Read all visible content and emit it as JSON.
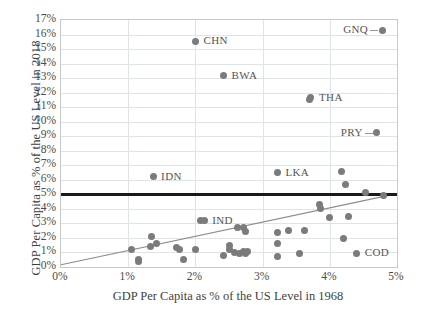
{
  "chart_data": {
    "type": "scatter",
    "title": "",
    "xlabel": "GDP Per Capita as % of the US Level in 1968",
    "ylabel": "GDP Per Capita as % of the US Level in 2018",
    "xlim": [
      0,
      5
    ],
    "ylim": [
      0,
      17
    ],
    "xticks": [
      "0%",
      "1%",
      "2%",
      "3%",
      "4%",
      "5%"
    ],
    "xtick_values": [
      0,
      1,
      2,
      3,
      4,
      5
    ],
    "yticks": [
      "0%",
      "1%",
      "2%",
      "3%",
      "4%",
      "5%",
      "6%",
      "7%",
      "8%",
      "9%",
      "10%",
      "11%",
      "12%",
      "13%",
      "14%",
      "15%",
      "16%",
      "17%"
    ],
    "ytick_values": [
      0,
      1,
      2,
      3,
      4,
      5,
      6,
      7,
      8,
      9,
      10,
      11,
      12,
      13,
      14,
      15,
      16,
      17
    ],
    "grid": true,
    "legend": "none",
    "marker_color": "#7b7b7b",
    "trendline_color": "#8c8c8c",
    "threshold_color": "#1a1a1a",
    "threshold": {
      "label": "",
      "y": 5.0,
      "description": "Horizontal black reference line at 5%"
    },
    "trendline": {
      "x0": 0.0,
      "y0": 0.15,
      "x1": 5.0,
      "y1": 5.05
    },
    "points": [
      {
        "x": 2.0,
        "y": 15.55,
        "label": "CHN"
      },
      {
        "x": 2.42,
        "y": 13.15,
        "label": "BWA"
      },
      {
        "x": 3.72,
        "y": 11.65,
        "label": "THA"
      },
      {
        "x": 3.7,
        "y": 11.55,
        "label": ""
      },
      {
        "x": 4.78,
        "y": 16.3,
        "label": "GNQ"
      },
      {
        "x": 4.7,
        "y": 9.25,
        "label": "PRY"
      },
      {
        "x": 1.37,
        "y": 6.2,
        "label": "IDN"
      },
      {
        "x": 3.22,
        "y": 6.5,
        "label": "LKA"
      },
      {
        "x": 2.08,
        "y": 3.2,
        "label": "IND"
      },
      {
        "x": 2.13,
        "y": 3.2,
        "label": ""
      },
      {
        "x": 4.4,
        "y": 0.95,
        "label": "COD"
      },
      {
        "x": 4.18,
        "y": 6.6,
        "label": ""
      },
      {
        "x": 4.23,
        "y": 5.65,
        "label": ""
      },
      {
        "x": 4.53,
        "y": 5.15,
        "label": ""
      },
      {
        "x": 4.8,
        "y": 4.9,
        "label": ""
      },
      {
        "x": 3.85,
        "y": 4.3,
        "label": ""
      },
      {
        "x": 3.86,
        "y": 4.05,
        "label": ""
      },
      {
        "x": 4.0,
        "y": 3.4,
        "label": ""
      },
      {
        "x": 4.28,
        "y": 3.45,
        "label": ""
      },
      {
        "x": 4.2,
        "y": 1.95,
        "label": ""
      },
      {
        "x": 3.22,
        "y": 2.4,
        "label": ""
      },
      {
        "x": 3.38,
        "y": 2.48,
        "label": ""
      },
      {
        "x": 3.62,
        "y": 2.48,
        "label": ""
      },
      {
        "x": 3.22,
        "y": 1.6,
        "label": ""
      },
      {
        "x": 3.22,
        "y": 0.7,
        "label": ""
      },
      {
        "x": 3.55,
        "y": 0.9,
        "label": ""
      },
      {
        "x": 2.62,
        "y": 2.72,
        "label": ""
      },
      {
        "x": 2.72,
        "y": 2.7,
        "label": ""
      },
      {
        "x": 2.75,
        "y": 2.45,
        "label": ""
      },
      {
        "x": 2.5,
        "y": 1.5,
        "label": ""
      },
      {
        "x": 2.5,
        "y": 1.18,
        "label": ""
      },
      {
        "x": 2.42,
        "y": 0.82,
        "label": ""
      },
      {
        "x": 2.58,
        "y": 0.98,
        "label": ""
      },
      {
        "x": 2.65,
        "y": 0.95,
        "label": ""
      },
      {
        "x": 2.72,
        "y": 1.1,
        "label": ""
      },
      {
        "x": 2.78,
        "y": 1.05,
        "label": ""
      },
      {
        "x": 2.75,
        "y": 0.95,
        "label": ""
      },
      {
        "x": 1.35,
        "y": 2.1,
        "label": ""
      },
      {
        "x": 1.42,
        "y": 1.65,
        "label": ""
      },
      {
        "x": 1.33,
        "y": 1.42,
        "label": ""
      },
      {
        "x": 1.05,
        "y": 1.22,
        "label": ""
      },
      {
        "x": 1.15,
        "y": 0.55,
        "label": ""
      },
      {
        "x": 1.15,
        "y": 0.4,
        "label": ""
      },
      {
        "x": 1.72,
        "y": 1.35,
        "label": ""
      },
      {
        "x": 1.77,
        "y": 1.2,
        "label": ""
      },
      {
        "x": 2.0,
        "y": 1.18,
        "label": ""
      },
      {
        "x": 1.82,
        "y": 0.52,
        "label": ""
      }
    ],
    "point_labels": [
      {
        "text": "CHN",
        "x": 2.0,
        "y": 15.55,
        "leader": false
      },
      {
        "text": "BWA",
        "x": 2.42,
        "y": 13.15,
        "leader": false
      },
      {
        "text": "THA",
        "x": 3.72,
        "y": 11.65,
        "leader": false
      },
      {
        "text": "GNQ",
        "x": 4.78,
        "y": 16.3,
        "leader": true
      },
      {
        "text": "PRY",
        "x": 4.7,
        "y": 9.25,
        "leader": true
      },
      {
        "text": "IDN",
        "x": 1.37,
        "y": 6.2,
        "leader": false
      },
      {
        "text": "LKA",
        "x": 3.22,
        "y": 6.5,
        "leader": false
      },
      {
        "text": "IND",
        "x": 2.13,
        "y": 3.2,
        "leader": false
      },
      {
        "text": "COD",
        "x": 4.4,
        "y": 0.95,
        "leader": false
      }
    ]
  }
}
